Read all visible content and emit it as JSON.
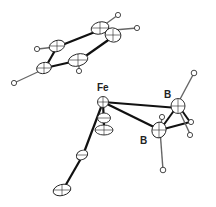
{
  "figure": {
    "type": "ORTEP crystal structure",
    "labels": [
      {
        "id": "fe",
        "text": "Fe",
        "x": 97,
        "y": 91
      },
      {
        "id": "b1",
        "text": "B",
        "x": 164,
        "y": 98
      },
      {
        "id": "b2",
        "text": "B",
        "x": 140,
        "y": 144
      }
    ]
  },
  "colors": {
    "bond": "#111111",
    "thin_bond": "#666666",
    "atom_outline": "#222222",
    "atom_fill": "#ffffff",
    "background": "#ffffff"
  }
}
